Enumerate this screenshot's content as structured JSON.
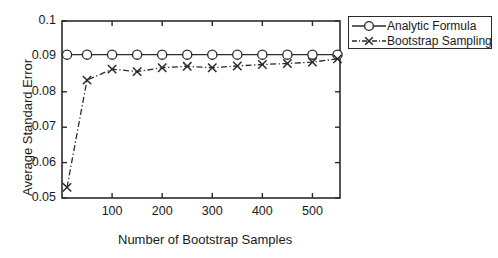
{
  "chart_data": {
    "type": "line",
    "title": "",
    "xlabel": "Number of Bootstrap Samples",
    "ylabel": "Average Standard Error",
    "xlim": [
      0,
      555
    ],
    "ylim": [
      0.05,
      0.1
    ],
    "xticks": [
      100,
      200,
      300,
      400,
      500
    ],
    "xticklabels": [
      "100",
      "200",
      "300",
      "400",
      "500"
    ],
    "yticks": [
      0.05,
      0.06,
      0.07,
      0.08,
      0.09,
      0.1
    ],
    "yticklabels": [
      "0.05",
      "0.06",
      "0.07",
      "0.08",
      "0.09",
      "0.1"
    ],
    "grid": false,
    "legend_position": "top-right",
    "x": [
      10,
      50,
      100,
      150,
      200,
      250,
      300,
      350,
      400,
      450,
      500,
      550
    ],
    "series": [
      {
        "name": "Analytic Formula",
        "marker": "circle",
        "linestyle": "solid",
        "color": "#2b2b2b",
        "values": [
          0.0905,
          0.0905,
          0.0905,
          0.0905,
          0.0905,
          0.0905,
          0.0905,
          0.0905,
          0.0905,
          0.0905,
          0.0905,
          0.0905
        ]
      },
      {
        "name": "Bootstrap Sampling",
        "marker": "x",
        "linestyle": "dashdot",
        "color": "#2b2b2b",
        "values": [
          0.053,
          0.0833,
          0.0864,
          0.0857,
          0.0868,
          0.0872,
          0.0868,
          0.0873,
          0.0877,
          0.088,
          0.0884,
          0.0893
        ]
      }
    ]
  },
  "legend": {
    "entries": [
      {
        "label": "Analytic Formula",
        "marker": "circle-marker",
        "line": "solid-line"
      },
      {
        "label": "Bootstrap Sampling",
        "marker": "x-marker",
        "line": "dashdot-line"
      }
    ]
  },
  "axes": {
    "y_label": "Average Standard Error",
    "x_label": "Number of Bootstrap Samples"
  }
}
